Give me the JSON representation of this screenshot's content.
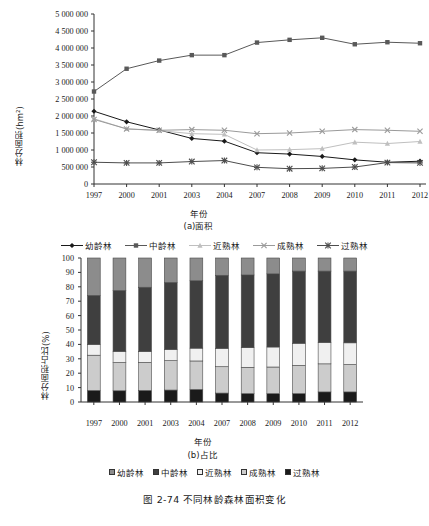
{
  "caption": "图 2-74   不同林龄森林面积变化",
  "categories": [
    "1997",
    "2000",
    "2001",
    "2003",
    "2004",
    "2007",
    "2008",
    "2009",
    "2010",
    "2011",
    "2012"
  ],
  "series_names": [
    "幼龄林",
    "中龄林",
    "近熟林",
    "成熟林",
    "过熟林"
  ],
  "colors": {
    "youling": "#1a1a1a",
    "zhongling": "#595959",
    "jinshu": "#bfbfbf",
    "chengshu": "#9a9a9a",
    "guoshu": "#4d4d4d",
    "axis": "#333333",
    "bar_youling": "#8c8c8c",
    "bar_zhongling": "#3f3f3f",
    "bar_jinshu": "#f0f0f0",
    "bar_chengshu": "#cccccc",
    "bar_guoshu": "#1a1a1a"
  },
  "panel_a": {
    "subcaption": "(a)面积",
    "xlabel": "年份",
    "ylabel": "林分面积(hm²)",
    "yticks": [
      "0",
      "500 000",
      "1 000 000",
      "1 500 000",
      "2 000 000",
      "2 500 000",
      "3 000 000",
      "3 500 000",
      "4 000 000",
      "4 500 000",
      "5 000 000"
    ],
    "legend": [
      "幼龄林",
      "中龄林",
      "近熟林",
      "成熟林",
      "过熟林"
    ]
  },
  "panel_b": {
    "subcaption": "(b)占比",
    "xlabel": "年份",
    "ylabel": "林分面积占比(%)",
    "yticks": [
      "0",
      "10",
      "20",
      "30",
      "40",
      "50",
      "60",
      "70",
      "80",
      "90",
      "100"
    ],
    "legend": [
      "幼龄林",
      "中龄林",
      "近熟林",
      "成熟林",
      "过熟林"
    ]
  },
  "chart_data": [
    {
      "type": "line",
      "title": "(a)面积",
      "xlabel": "年份",
      "ylabel": "林分面积(hm²)",
      "ylim": [
        0,
        5000000
      ],
      "ytick_values": [
        0,
        500000,
        1000000,
        1500000,
        2000000,
        2500000,
        3000000,
        3500000,
        4000000,
        4500000,
        5000000
      ],
      "grid": false,
      "legend_position": "below",
      "categories": [
        "1997",
        "2000",
        "2001",
        "2003",
        "2004",
        "2007",
        "2008",
        "2009",
        "2010",
        "2011",
        "2012"
      ],
      "series": [
        {
          "name": "幼龄林",
          "marker": "diamond",
          "color": "#1a1a1a",
          "values": [
            2140000,
            1830000,
            1590000,
            1340000,
            1260000,
            920000,
            880000,
            810000,
            710000,
            640000,
            670000
          ]
        },
        {
          "name": "中龄林",
          "marker": "square",
          "color": "#595959",
          "values": [
            2720000,
            3390000,
            3630000,
            3790000,
            3790000,
            4160000,
            4240000,
            4300000,
            4110000,
            4170000,
            4140000
          ]
        },
        {
          "name": "近熟林",
          "marker": "triangle",
          "color": "#bfbfbf",
          "values": [
            1920000,
            1620000,
            1570000,
            1480000,
            1460000,
            1000000,
            1010000,
            1040000,
            1230000,
            1190000,
            1250000
          ]
        },
        {
          "name": "成熟林",
          "marker": "cross",
          "color": "#9a9a9a",
          "values": [
            1900000,
            1620000,
            1580000,
            1600000,
            1580000,
            1480000,
            1500000,
            1550000,
            1600000,
            1580000,
            1550000
          ]
        },
        {
          "name": "过熟林",
          "marker": "star",
          "color": "#4d4d4d",
          "values": [
            640000,
            620000,
            620000,
            660000,
            690000,
            490000,
            450000,
            460000,
            500000,
            630000,
            620000
          ]
        }
      ]
    },
    {
      "type": "bar",
      "stacked": true,
      "title": "(b)占比",
      "xlabel": "年份",
      "ylabel": "林分面积占比(%)",
      "ylim": [
        0,
        100
      ],
      "ytick_values": [
        0,
        10,
        20,
        30,
        40,
        50,
        60,
        70,
        80,
        90,
        100
      ],
      "grid": false,
      "legend_position": "below",
      "categories": [
        "1997",
        "2000",
        "2001",
        "2003",
        "2004",
        "2007",
        "2008",
        "2009",
        "2010",
        "2011",
        "2012"
      ],
      "stack_order_bottom_to_top": [
        "过熟林",
        "成熟林",
        "近熟林",
        "中龄林",
        "幼龄林"
      ],
      "series": [
        {
          "name": "过熟林",
          "color": "#1a1a1a",
          "values": [
            8.0,
            7.8,
            8.0,
            8.3,
            8.7,
            6.2,
            5.8,
            5.8,
            5.8,
            7.0,
            7.0
          ]
        },
        {
          "name": "成熟林",
          "color": "#cccccc",
          "values": [
            24.5,
            19.6,
            19.5,
            20.4,
            19.8,
            18.3,
            18.3,
            18.5,
            19.6,
            19.5,
            19.0
          ]
        },
        {
          "name": "近熟林",
          "color": "#f0f0f0",
          "values": [
            7.5,
            7.8,
            7.6,
            7.8,
            8.9,
            12.8,
            13.7,
            13.9,
            15.4,
            14.9,
            15.1
          ]
        },
        {
          "name": "中龄林",
          "color": "#3f3f3f",
          "values": [
            34.0,
            42.2,
            44.6,
            46.5,
            46.8,
            50.7,
            50.4,
            50.8,
            50.1,
            49.5,
            49.8
          ]
        },
        {
          "name": "幼龄林",
          "color": "#8c8c8c",
          "values": [
            26.0,
            22.6,
            20.3,
            17.0,
            15.8,
            12.0,
            11.8,
            11.0,
            9.1,
            9.1,
            9.1
          ]
        }
      ]
    }
  ]
}
